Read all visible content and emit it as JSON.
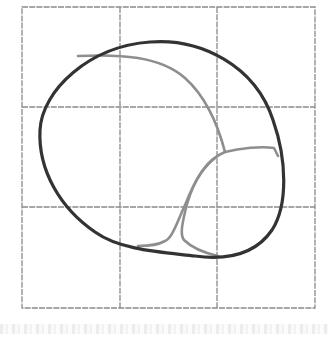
{
  "figure": {
    "grid": {
      "rows": 3,
      "cols": 3,
      "x_lines": [
        22,
        120,
        217,
        315
      ],
      "y_lines": [
        7,
        107,
        207,
        308
      ],
      "color": "#8a8a8a"
    },
    "outline": {
      "shape": "tilted-egg",
      "color": "#333333",
      "stroke_width": 3
    },
    "seams": {
      "color": "#8e8e8e",
      "stroke_width": 2.5,
      "count": 4
    },
    "footer_noise": ""
  }
}
